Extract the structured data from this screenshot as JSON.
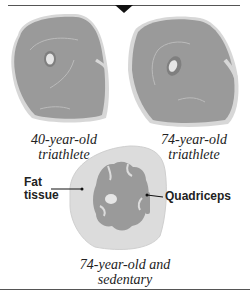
{
  "figure": {
    "panels": [
      {
        "caption_line1": "40-year-old",
        "caption_line2": "triathlete"
      },
      {
        "caption_line1": "74-year-old",
        "caption_line2": "triathlete"
      },
      {
        "caption_line1": "74-year-old and",
        "caption_line2": "sedentary"
      }
    ],
    "labels": {
      "fat_line1": "Fat",
      "fat_line2": "tissue",
      "muscle": "Quadriceps"
    },
    "colors": {
      "muscle": "#9a9a9a",
      "fat": "#dcdcdc",
      "outline": "#c8c8c8",
      "bone": "#e6e6e6",
      "rule": "#555555",
      "arrow": "#111111"
    }
  }
}
